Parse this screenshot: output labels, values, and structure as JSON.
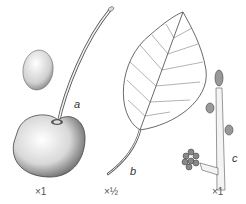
{
  "figure": {
    "panels": [
      {
        "id": "a",
        "label": "a",
        "subject": "cherry-fruit-with-stalk",
        "scale": "×1"
      },
      {
        "id": "b",
        "label": "b",
        "subject": "leaf",
        "scale": "×½"
      },
      {
        "id": "c",
        "label": "c",
        "subject": "twig-with-buds",
        "scale": "×1"
      }
    ],
    "stone_subject": "cherry-stone"
  },
  "colors": {
    "ink": "#333333",
    "background": "#ffffff"
  }
}
